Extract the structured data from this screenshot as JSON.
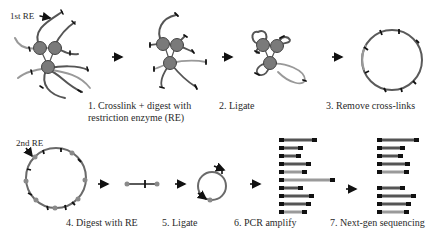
{
  "colors": {
    "strand_dark": "#555555",
    "strand_light": "#9a9a9a",
    "node_fill": "#7a7a7a",
    "node_stroke": "#444444",
    "site_mark": "#111111",
    "arrow": "#111111"
  },
  "annotations": {
    "first_re": "1st RE",
    "second_re": "2nd RE"
  },
  "steps": [
    {
      "number": "1.",
      "label_line1": "1. Crosslink + digest with",
      "label_line2": "restriction enzyme (RE)"
    },
    {
      "number": "2.",
      "label_line1": "2. Ligate"
    },
    {
      "number": "3.",
      "label_line1": "3. Remove cross-links"
    },
    {
      "number": "4.",
      "label_line1": "4. Digest with RE"
    },
    {
      "number": "5.",
      "label_line1": "5. Ligate"
    },
    {
      "number": "6.",
      "label_line1": "6. PCR amplify"
    },
    {
      "number": "7.",
      "label_line1": "7. Next-gen sequencing"
    }
  ],
  "pcr_bars": [
    {
      "length": 36,
      "light": false
    },
    {
      "length": 22,
      "light": false
    },
    {
      "length": 20,
      "light": false
    },
    {
      "length": 30,
      "light": false
    },
    {
      "length": 26,
      "light": true
    },
    {
      "length": 54,
      "light": true
    },
    {
      "length": 22,
      "light": false
    },
    {
      "length": 33,
      "light": false
    },
    {
      "length": 30,
      "light": false
    },
    {
      "length": 26,
      "light": true
    }
  ],
  "seq_bars": [
    {
      "length": 40,
      "light": false
    },
    {
      "length": 26,
      "light": false
    },
    {
      "length": 24,
      "light": false
    },
    {
      "length": 31,
      "light": false
    },
    {
      "length": 30,
      "light": true
    },
    {
      "length": 26,
      "light": false
    },
    {
      "length": 37,
      "light": false
    },
    {
      "length": 32,
      "light": false
    },
    {
      "length": 30,
      "light": true
    }
  ]
}
